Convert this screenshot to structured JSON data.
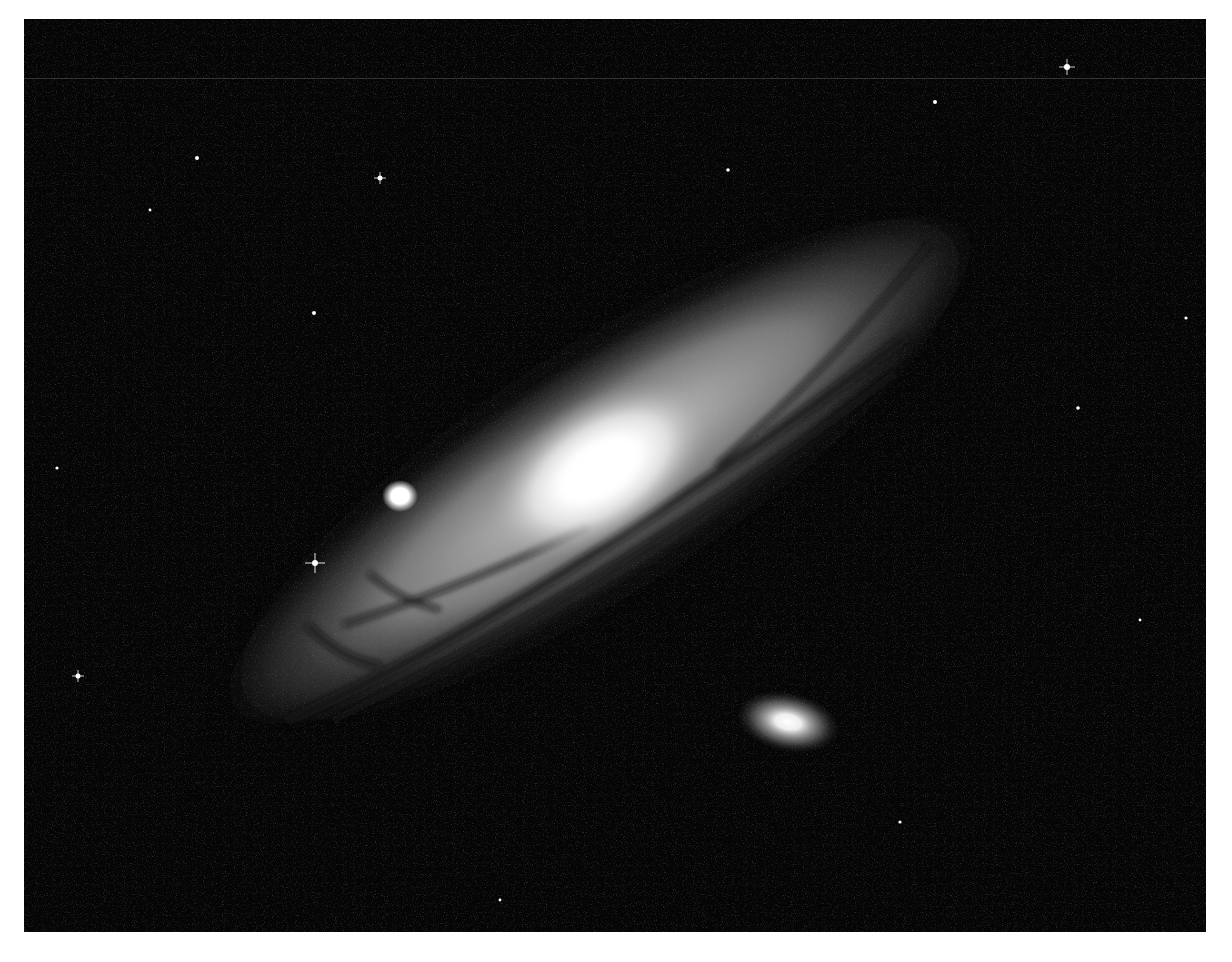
{
  "image": {
    "subject": "Andromeda Galaxy (spiral galaxy) with two satellite galaxies",
    "style": "black-and-white astronomical photograph",
    "background_color": "#ffffff",
    "sky_color": "#050505"
  },
  "galaxy": {
    "center": [
      600,
      470
    ],
    "rotation_deg": -33,
    "core_color": "#ffffff",
    "disk_color": "#bfbfbf",
    "dust_color": "#1a1a1a"
  },
  "satellites": [
    {
      "name": "compact-satellite",
      "center": [
        400,
        496
      ],
      "rx": 14,
      "ry": 12
    },
    {
      "name": "elliptical-satellite",
      "center": [
        788,
        722
      ],
      "rx": 48,
      "ry": 26,
      "rotation_deg": 12
    }
  ],
  "bright_stars": [
    [
      380,
      178
    ],
    [
      197,
      158
    ],
    [
      315,
      563
    ],
    [
      78,
      676
    ],
    [
      1067,
      67
    ],
    [
      935,
      102
    ],
    [
      314,
      313
    ],
    [
      728,
      170
    ],
    [
      1078,
      408
    ]
  ]
}
